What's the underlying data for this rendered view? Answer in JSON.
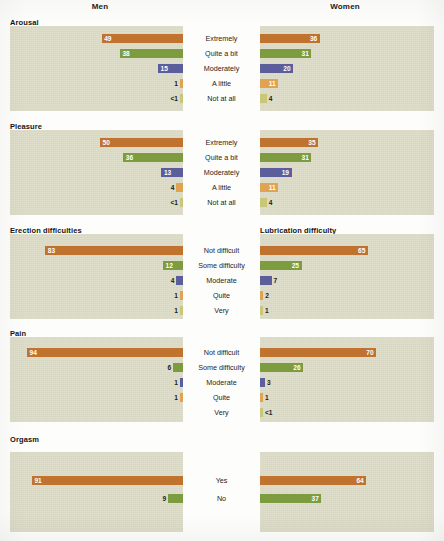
{
  "headers": {
    "left": "Men",
    "right": "Women"
  },
  "colors": {
    "panel_background": "#dcdcc6",
    "page_background": "#fdfdfb",
    "extremely": "#c0722f",
    "quite_a_bit": "#7d9b3f",
    "moderately": "#5b5e9b",
    "a_little": "#e0a352",
    "not_at_all": "#c9c87a",
    "value_label_inside": "#ffffff",
    "value_label_outside": "#1b1b1b"
  },
  "chart_data": {
    "type": "bar",
    "title": "",
    "xlabel": "",
    "ylabel": "",
    "xlim": [
      0,
      100
    ],
    "grid": false,
    "legend": "none",
    "orientation": "horizontal-diverging",
    "note": "Percent of respondents; men's bars extend leftward, women's rightward from centered category labels.",
    "panels": [
      {
        "title_left": "Arousal",
        "title_right": "",
        "categories": [
          "Extremely",
          "Quite a bit",
          "Moderately",
          "A little",
          "Not at all"
        ],
        "series": [
          {
            "name": "Men",
            "values": [
              49,
              38,
              15,
              1,
              0.5
            ],
            "labels": [
              "49",
              "38",
              "15",
              "1",
              "<1"
            ]
          },
          {
            "name": "Women",
            "values": [
              36,
              31,
              20,
              11,
              4
            ],
            "labels": [
              "36",
              "31",
              "20",
              "11",
              "4"
            ]
          }
        ]
      },
      {
        "title_left": "Pleasure",
        "title_right": "",
        "categories": [
          "Extremely",
          "Quite a bit",
          "Moderately",
          "A little",
          "Not at all"
        ],
        "series": [
          {
            "name": "Men",
            "values": [
              50,
              36,
              13,
              4,
              0.5
            ],
            "labels": [
              "50",
              "36",
              "13",
              "4",
              "<1"
            ]
          },
          {
            "name": "Women",
            "values": [
              35,
              31,
              19,
              11,
              4
            ],
            "labels": [
              "35",
              "31",
              "19",
              "11",
              "4"
            ]
          }
        ]
      },
      {
        "title_left": "Erection difficulties",
        "title_right": "Lubrication difficulty",
        "categories": [
          "Not difficult",
          "Some difficulty",
          "Moderate",
          "Quite",
          "Very"
        ],
        "series": [
          {
            "name": "Men",
            "values": [
              83,
              12,
              4,
              1,
              1
            ],
            "labels": [
              "83",
              "12",
              "4",
              "1",
              "1"
            ]
          },
          {
            "name": "Women",
            "values": [
              65,
              25,
              7,
              2,
              1
            ],
            "labels": [
              "65",
              "25",
              "7",
              "2",
              "1"
            ]
          }
        ]
      },
      {
        "title_left": "Pain",
        "title_right": "",
        "categories": [
          "Not difficult",
          "Some difficulty",
          "Moderate",
          "Quite",
          "Very"
        ],
        "series": [
          {
            "name": "Men",
            "values": [
              94,
              6,
              1,
              1,
              0
            ],
            "labels": [
              "94",
              "6",
              "1",
              "1",
              ""
            ]
          },
          {
            "name": "Women",
            "values": [
              70,
              26,
              3,
              1,
              0.5
            ],
            "labels": [
              "70",
              "26",
              "3",
              "1",
              "<1"
            ]
          }
        ]
      },
      {
        "title_left": "Orgasm",
        "title_right": "",
        "categories": [
          "Yes",
          "No"
        ],
        "series": [
          {
            "name": "Men",
            "values": [
              91,
              9
            ],
            "labels": [
              "91",
              "9"
            ]
          },
          {
            "name": "Women",
            "values": [
              64,
              37
            ],
            "labels": [
              "64",
              "37"
            ]
          }
        ]
      }
    ]
  }
}
